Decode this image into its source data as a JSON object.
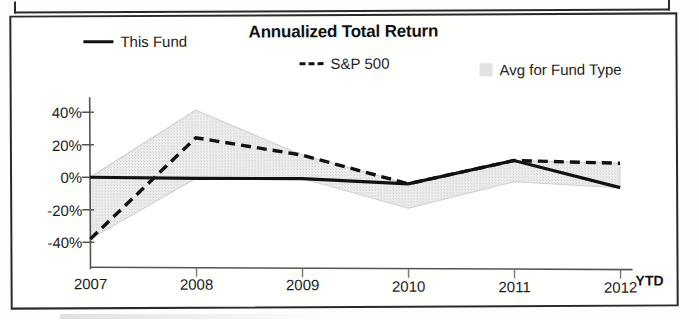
{
  "card": {
    "title": "Annualized Total Return"
  },
  "legend": [
    {
      "key": "this_fund",
      "label": "This Fund",
      "marker": "solid-line-swatch",
      "color": "#111111"
    },
    {
      "key": "sp500",
      "label": "S&P 500",
      "marker": "dashed-line-swatch",
      "color": "#111111"
    },
    {
      "key": "avg",
      "label": "Avg for Fund Type",
      "marker": "gray-band-swatch",
      "color": "#e2e2e2"
    }
  ],
  "axis": {
    "y_ticks": [
      "40%",
      "20%",
      "0%",
      "-20%",
      "-40%"
    ],
    "x_ticks": [
      "2007",
      "2008",
      "2009",
      "2010",
      "2011",
      "2012"
    ],
    "ytd_suffix": "YTD"
  },
  "chart_data": {
    "type": "line",
    "title": "Annualized Total Return",
    "xlabel": "",
    "ylabel": "",
    "categories": [
      "2007",
      "2008",
      "2009",
      "2010",
      "2011",
      "2012"
    ],
    "x_tick_labels": [
      "2007",
      "2008",
      "2009",
      "2010",
      "2011",
      "2012 YTD"
    ],
    "y_tick_labels": [
      "40%",
      "20%",
      "0%",
      "-20%",
      "-40%"
    ],
    "y_ticks": [
      40,
      20,
      0,
      -20,
      -40
    ],
    "ylim": [
      -48,
      44
    ],
    "grid": false,
    "legend_position": "top",
    "units": "percent",
    "series": [
      {
        "name": "This Fund",
        "style": "solid",
        "color": "#111111",
        "values": [
          0,
          -1,
          -1.5,
          -5,
          9,
          -8
        ]
      },
      {
        "name": "S&P 500",
        "style": "dashed",
        "color": "#111111",
        "values": [
          -38,
          24,
          13,
          -5,
          9,
          7
        ]
      }
    ],
    "band": {
      "name": "Avg for Fund Type",
      "style": "filled-range",
      "color": "#e8e8e8",
      "upper": [
        0,
        41,
        13,
        -5,
        9,
        7
      ],
      "lower": [
        -38,
        -1,
        -1.5,
        -20,
        -4,
        -8
      ]
    }
  }
}
